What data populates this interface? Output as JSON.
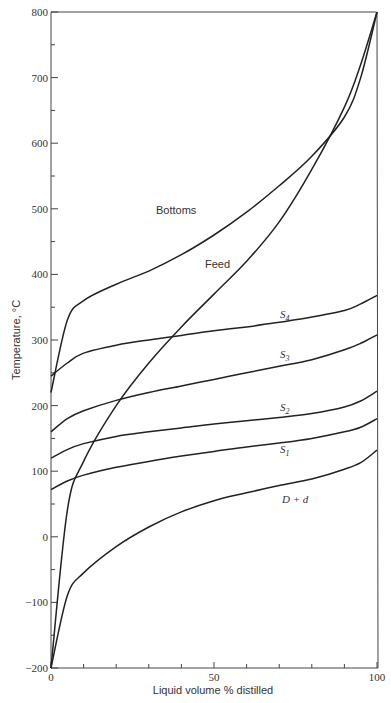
{
  "chart_data": {
    "type": "line",
    "title": "",
    "xlabel": "Liquid volume % distilled",
    "ylabel": "Temperature, °C",
    "xlim": [
      0,
      100
    ],
    "ylim": [
      -200,
      800
    ],
    "grid": false,
    "legend": "inline curve labels",
    "x_ticks": [
      "0",
      "50",
      "100"
    ],
    "y_ticks": [
      "-200",
      "-100",
      "0",
      "100",
      "200",
      "300",
      "400",
      "500",
      "600",
      "700",
      "800"
    ],
    "x": [
      0,
      5,
      10,
      20,
      30,
      40,
      50,
      60,
      70,
      80,
      90,
      95,
      100
    ],
    "series": [
      {
        "name": "Bottoms",
        "label": "Bottoms",
        "values": [
          220,
          330,
          360,
          385,
          405,
          430,
          460,
          495,
          535,
          580,
          640,
          700,
          800
        ]
      },
      {
        "name": "Feed",
        "label": "Feed",
        "values": [
          -200,
          40,
          115,
          200,
          265,
          320,
          370,
          420,
          480,
          560,
          655,
          720,
          800
        ]
      },
      {
        "name": "S4",
        "label": "S4",
        "values": [
          245,
          265,
          280,
          292,
          300,
          307,
          314,
          320,
          327,
          335,
          345,
          355,
          368
        ]
      },
      {
        "name": "S3",
        "label": "S3",
        "values": [
          160,
          180,
          192,
          208,
          220,
          230,
          240,
          250,
          260,
          270,
          285,
          295,
          308
        ]
      },
      {
        "name": "S2",
        "label": "S2",
        "values": [
          120,
          133,
          142,
          153,
          160,
          166,
          172,
          177,
          182,
          188,
          198,
          207,
          222
        ]
      },
      {
        "name": "S1",
        "label": "S1",
        "values": [
          72,
          85,
          94,
          106,
          115,
          123,
          130,
          137,
          143,
          150,
          160,
          167,
          180
        ]
      },
      {
        "name": "D + d",
        "label": "D + d",
        "values": [
          -200,
          -90,
          -55,
          -15,
          15,
          38,
          55,
          67,
          78,
          88,
          103,
          113,
          132
        ]
      }
    ]
  },
  "labels": {
    "bottoms": "Bottoms",
    "feed": "Feed",
    "s4": "S",
    "s4_sub": "4",
    "s3": "S",
    "s3_sub": "3",
    "s2": "S",
    "s2_sub": "2",
    "s1": "S",
    "s1_sub": "1",
    "dd": "D + d"
  },
  "axes": {
    "xlabel": "Liquid volume % distilled",
    "ylabel": "Temperature, °C",
    "y_tick_labels": [
      "800",
      "700",
      "600",
      "500",
      "400",
      "300",
      "200",
      "100",
      "0",
      "-100",
      "-200"
    ],
    "x_tick_labels": [
      "0",
      "50",
      "100"
    ]
  }
}
